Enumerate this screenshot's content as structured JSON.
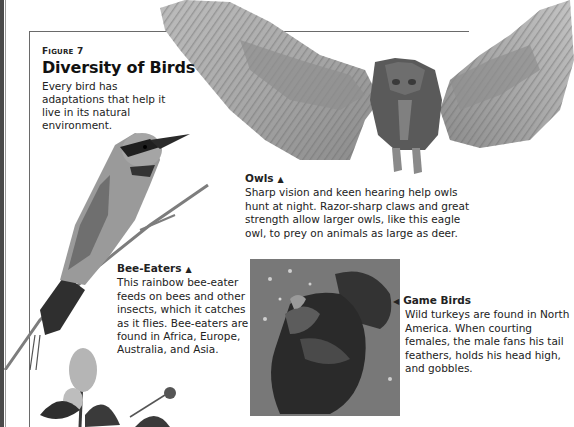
{
  "figure": {
    "label_first": "F",
    "label_rest": "IGURE",
    "number": "7",
    "title": "Diversity of Birds",
    "description": "Every bird has adaptations that help it live in its natural environment."
  },
  "captions": {
    "owls": {
      "heading": "Owls",
      "pointer": "▲",
      "text": "Sharp vision and keen hearing help owls hunt at night. Razor-sharp claws and great strength allow larger owls, like this eagle owl, to prey on animals as large as deer."
    },
    "bee_eaters": {
      "heading": "Bee-Eaters",
      "pointer": "▲",
      "text": "This rainbow bee-eater feeds on bees and other insects, which it catches as it flies. Bee-eaters are found in Africa, Europe, Australia, and Asia."
    },
    "game_birds": {
      "heading": "Game Birds",
      "pointer": "◀",
      "text": "Wild turkeys are found in North America. When courting females, the male fans his tail feathers, holds his head high, and gobbles."
    }
  },
  "images": {
    "owl": "eagle-owl-wings-spread",
    "bee_eater": "rainbow-bee-eater-on-branch",
    "turkey": "wild-turkey-displaying",
    "flower": "flowering-plant"
  },
  "colors": {
    "page_edge": "#4a4a4a",
    "frame_line": "#6a6a6a",
    "text": "#222222"
  }
}
